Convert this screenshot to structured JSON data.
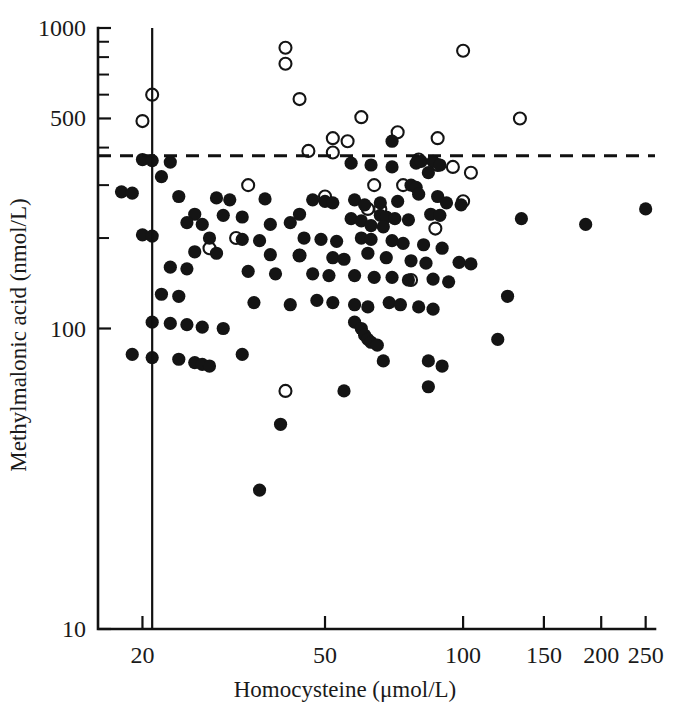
{
  "chart_data": {
    "type": "scatter",
    "title": "",
    "xlabel": "Homocysteine (μmol/L)",
    "ylabel": "Methylmalonic acid (nmol/L)",
    "xscale": "log",
    "yscale": "log",
    "xlim": [
      16,
      262
    ],
    "ylim": [
      10,
      1000
    ],
    "xticks": [
      20,
      50,
      100,
      150,
      200,
      250
    ],
    "xtick_labels": [
      "20",
      "50",
      "100",
      "150",
      "200",
      "250"
    ],
    "yticks": [
      10,
      100,
      500,
      1000
    ],
    "ytick_labels": [
      "10",
      "100",
      "500",
      "1000"
    ],
    "y_minor_ticks": [
      200,
      300,
      400,
      600,
      700,
      800,
      900
    ],
    "grid": false,
    "legend": null,
    "reference_lines": [
      {
        "name": "homocysteine-cutoff",
        "orientation": "vertical",
        "value": 21,
        "style": "solid"
      },
      {
        "name": "methylmalonic-acid-cutoff",
        "orientation": "horizontal",
        "value": 376,
        "style": "dashed"
      }
    ],
    "series": [
      {
        "name": "open-circle-marker",
        "marker": "open-circle",
        "color": "#141414",
        "points": [
          [
            41,
            860
          ],
          [
            41,
            760
          ],
          [
            100,
            840
          ],
          [
            21,
            600
          ],
          [
            44,
            580
          ],
          [
            133,
            500
          ],
          [
            20,
            490
          ],
          [
            60,
            505
          ],
          [
            72,
            450
          ],
          [
            52,
            430
          ],
          [
            56,
            420
          ],
          [
            88,
            430
          ],
          [
            46,
            390
          ],
          [
            52,
            385
          ],
          [
            80,
            365
          ],
          [
            88,
            350
          ],
          [
            95,
            345
          ],
          [
            104,
            330
          ],
          [
            34,
            300
          ],
          [
            64,
            300
          ],
          [
            74,
            300
          ],
          [
            50,
            275
          ],
          [
            100,
            265
          ],
          [
            62,
            250
          ],
          [
            66,
            250
          ],
          [
            87,
            215
          ],
          [
            32,
            200
          ],
          [
            28,
            185
          ],
          [
            44,
            175
          ],
          [
            77,
            145
          ],
          [
            41,
            62
          ]
        ]
      },
      {
        "name": "filled-circle-marker",
        "marker": "filled-circle",
        "color": "#141414",
        "points": [
          [
            70,
            420
          ],
          [
            20,
            365
          ],
          [
            21,
            362
          ],
          [
            23,
            358
          ],
          [
            57,
            355
          ],
          [
            63,
            350
          ],
          [
            79,
            355
          ],
          [
            81,
            360
          ],
          [
            86,
            360
          ],
          [
            89,
            350
          ],
          [
            70,
            345
          ],
          [
            22,
            320
          ],
          [
            84,
            330
          ],
          [
            18,
            285
          ],
          [
            19,
            282
          ],
          [
            24,
            275
          ],
          [
            29,
            272
          ],
          [
            31,
            268
          ],
          [
            37,
            270
          ],
          [
            47,
            268
          ],
          [
            50,
            265
          ],
          [
            52,
            262
          ],
          [
            58,
            268
          ],
          [
            61,
            258
          ],
          [
            66,
            262
          ],
          [
            72,
            265
          ],
          [
            77,
            300
          ],
          [
            79,
            295
          ],
          [
            80,
            280
          ],
          [
            88,
            275
          ],
          [
            92,
            262
          ],
          [
            99,
            258
          ],
          [
            26,
            240
          ],
          [
            30,
            238
          ],
          [
            33,
            235
          ],
          [
            44,
            240
          ],
          [
            57,
            232
          ],
          [
            60,
            228
          ],
          [
            66,
            238
          ],
          [
            68,
            235
          ],
          [
            71,
            232
          ],
          [
            85,
            240
          ],
          [
            89,
            238
          ],
          [
            25,
            225
          ],
          [
            27,
            222
          ],
          [
            38,
            222
          ],
          [
            42,
            225
          ],
          [
            63,
            220
          ],
          [
            67,
            218
          ],
          [
            76,
            230
          ],
          [
            134,
            232
          ],
          [
            185,
            222
          ],
          [
            250,
            250
          ],
          [
            20,
            205
          ],
          [
            21,
            203
          ],
          [
            28,
            200
          ],
          [
            33,
            198
          ],
          [
            36,
            196
          ],
          [
            45,
            200
          ],
          [
            49,
            198
          ],
          [
            53,
            195
          ],
          [
            60,
            200
          ],
          [
            63,
            198
          ],
          [
            70,
            196
          ],
          [
            74,
            192
          ],
          [
            82,
            190
          ],
          [
            90,
            185
          ],
          [
            26,
            180
          ],
          [
            29,
            178
          ],
          [
            38,
            176
          ],
          [
            44,
            175
          ],
          [
            52,
            172
          ],
          [
            55,
            170
          ],
          [
            62,
            178
          ],
          [
            68,
            172
          ],
          [
            77,
            168
          ],
          [
            83,
            165
          ],
          [
            98,
            166
          ],
          [
            104,
            164
          ],
          [
            23,
            160
          ],
          [
            25,
            158
          ],
          [
            34,
            155
          ],
          [
            39,
            152
          ],
          [
            47,
            152
          ],
          [
            51,
            150
          ],
          [
            58,
            150
          ],
          [
            64,
            148
          ],
          [
            70,
            148
          ],
          [
            76,
            145
          ],
          [
            86,
            146
          ],
          [
            93,
            143
          ],
          [
            125,
            128
          ],
          [
            22,
            130
          ],
          [
            24,
            128
          ],
          [
            35,
            122
          ],
          [
            42,
            120
          ],
          [
            48,
            124
          ],
          [
            52,
            122
          ],
          [
            58,
            120
          ],
          [
            62,
            118
          ],
          [
            69,
            122
          ],
          [
            73,
            120
          ],
          [
            80,
            118
          ],
          [
            86,
            116
          ],
          [
            21,
            105
          ],
          [
            23,
            104
          ],
          [
            25,
            103
          ],
          [
            27,
            101
          ],
          [
            30,
            100
          ],
          [
            58,
            105
          ],
          [
            60,
            100
          ],
          [
            61,
            95
          ],
          [
            62,
            92
          ],
          [
            63,
            90
          ],
          [
            65,
            88
          ],
          [
            19,
            82
          ],
          [
            21,
            80
          ],
          [
            24,
            79
          ],
          [
            26,
            77
          ],
          [
            27,
            76
          ],
          [
            28,
            75
          ],
          [
            33,
            82
          ],
          [
            67,
            78
          ],
          [
            84,
            78
          ],
          [
            90,
            75
          ],
          [
            119,
            92
          ],
          [
            55,
            62
          ],
          [
            84,
            64
          ],
          [
            40,
            48
          ],
          [
            36,
            29
          ]
        ]
      }
    ]
  },
  "geometry": {
    "plot_left": 98,
    "plot_right": 655,
    "plot_top": 28,
    "plot_bottom": 629
  }
}
